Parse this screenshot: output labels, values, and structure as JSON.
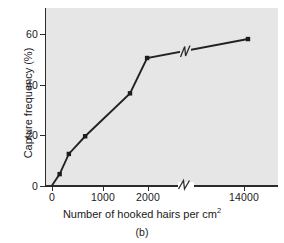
{
  "figure": {
    "panel_label": "(b)",
    "background_color": "#e6e6e6",
    "line_color": "#222222"
  },
  "chart_data": {
    "type": "line",
    "title": "",
    "subtitle": "",
    "xlabel": "Number of hooked hairs per cm",
    "xlabel_superscript": "2",
    "ylabel": "Capture frequency (%)",
    "x": [
      0,
      150,
      330,
      650,
      1600,
      1980,
      14500
    ],
    "values": [
      0,
      4.5,
      12.5,
      19.5,
      36.5,
      50.5,
      58
    ],
    "series": [
      {
        "name": "Capture frequency",
        "x": [
          0,
          150,
          330,
          650,
          1600,
          1980,
          14500
        ],
        "values": [
          0,
          4.5,
          12.5,
          19.5,
          36.5,
          50.5,
          58
        ]
      }
    ],
    "xlim": [
      0,
      15200
    ],
    "ylim": [
      0,
      68
    ],
    "xticks": [
      0,
      1000,
      2000,
      14000
    ],
    "xticklabels": [
      "0",
      "1000",
      "2000",
      "14000"
    ],
    "yticks": [
      0,
      20,
      40,
      60
    ],
    "yticklabels": [
      "0",
      "20",
      "40",
      "60"
    ],
    "grid": false,
    "legend": false,
    "legend_position": "none",
    "axis_break": {
      "axis": "x",
      "symbol": "zigzag",
      "note": "broken x-axis between 2000 and 14000"
    },
    "markers": "filled-square",
    "annotations": []
  },
  "ticks": {
    "y": [
      {
        "label": "60",
        "top": 34
      },
      {
        "label": "40",
        "top": 84.5
      },
      {
        "label": "20",
        "top": 135
      },
      {
        "label": "0",
        "top": 185.5
      }
    ],
    "x": [
      {
        "label": "0",
        "left": 52
      },
      {
        "label": "1000",
        "left": 103
      },
      {
        "label": "2000",
        "left": 148
      },
      {
        "label": "14000",
        "left": 244
      }
    ]
  }
}
